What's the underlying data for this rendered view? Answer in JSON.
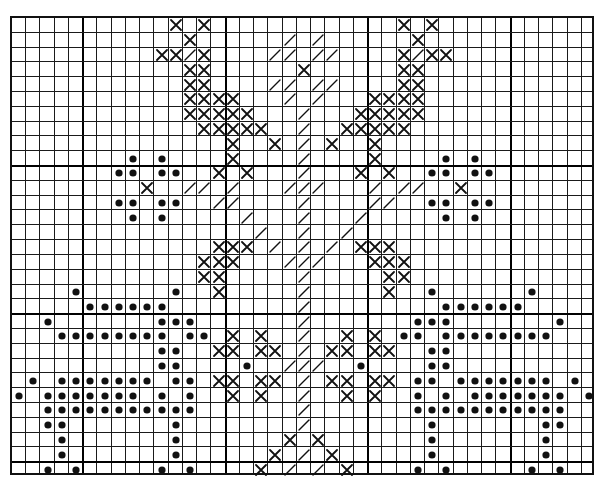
{
  "pattern": {
    "title": "Cross-stitch chart",
    "columns": 41,
    "rows": 31,
    "major_grid_columns": [
      5,
      15,
      25,
      35
    ],
    "major_grid_rows": [
      10,
      20,
      30
    ],
    "legend": {
      "x": "cross-stitch",
      "slash": "half-stitch",
      "dot": "bead / french knot"
    },
    "colors": {
      "ink": "#111111",
      "paper": "#ffffff"
    },
    "marks": [
      {
        "row": 0,
        "x": [
          11,
          13,
          27,
          29
        ],
        "slash": [],
        "dot": []
      },
      {
        "row": 1,
        "x": [
          12,
          28
        ],
        "slash": [
          19,
          21
        ],
        "dot": []
      },
      {
        "row": 2,
        "x": [
          10,
          11,
          13,
          27,
          29,
          30
        ],
        "slash": [
          12,
          18,
          19,
          21,
          22,
          28
        ],
        "dot": []
      },
      {
        "row": 3,
        "x": [
          12,
          13,
          20,
          27,
          28
        ],
        "slash": [],
        "dot": []
      },
      {
        "row": 4,
        "x": [
          12,
          13,
          27,
          28
        ],
        "slash": [
          18,
          19,
          21,
          22
        ],
        "dot": []
      },
      {
        "row": 5,
        "x": [
          12,
          13,
          14,
          15,
          25,
          26,
          27,
          28
        ],
        "slash": [
          19,
          21
        ],
        "dot": []
      },
      {
        "row": 6,
        "x": [
          12,
          13,
          14,
          15,
          16,
          24,
          25,
          26,
          27,
          28
        ],
        "slash": [
          20
        ],
        "dot": []
      },
      {
        "row": 7,
        "x": [
          13,
          14,
          15,
          16,
          17,
          23,
          24,
          25,
          26,
          27
        ],
        "slash": [
          20
        ],
        "dot": []
      },
      {
        "row": 8,
        "x": [
          15,
          18,
          22,
          25
        ],
        "slash": [
          20
        ],
        "dot": []
      },
      {
        "row": 9,
        "x": [
          15,
          25
        ],
        "slash": [
          20
        ],
        "dot": [
          8,
          10,
          30,
          32
        ]
      },
      {
        "row": 10,
        "x": [
          14,
          16,
          24,
          26
        ],
        "slash": [
          20
        ],
        "dot": [
          7,
          8,
          10,
          11,
          29,
          30,
          32,
          33
        ]
      },
      {
        "row": 11,
        "x": [
          9,
          31
        ],
        "slash": [
          12,
          13,
          15,
          19,
          20,
          21,
          25,
          27,
          28
        ],
        "dot": []
      },
      {
        "row": 12,
        "x": [],
        "slash": [
          14,
          15,
          20,
          25,
          26
        ],
        "dot": [
          7,
          8,
          10,
          11,
          29,
          30,
          32,
          33
        ]
      },
      {
        "row": 13,
        "x": [],
        "slash": [
          16,
          20,
          24
        ],
        "dot": [
          8,
          10,
          30,
          32
        ]
      },
      {
        "row": 14,
        "x": [],
        "slash": [
          17,
          20,
          23
        ],
        "dot": []
      },
      {
        "row": 15,
        "x": [
          14,
          15,
          16,
          24,
          25,
          26
        ],
        "slash": [
          18,
          20,
          22
        ],
        "dot": []
      },
      {
        "row": 16,
        "x": [
          13,
          14,
          15,
          25,
          26,
          27
        ],
        "slash": [
          19,
          20,
          21
        ],
        "dot": []
      },
      {
        "row": 17,
        "x": [
          13,
          14,
          26,
          27
        ],
        "slash": [
          20
        ],
        "dot": []
      },
      {
        "row": 18,
        "x": [
          14,
          26
        ],
        "slash": [
          20
        ],
        "dot": [
          4,
          11,
          29,
          36
        ]
      },
      {
        "row": 19,
        "x": [],
        "slash": [
          20
        ],
        "dot": [
          5,
          6,
          7,
          8,
          9,
          10,
          30,
          31,
          32,
          33,
          34,
          35
        ]
      },
      {
        "row": 20,
        "x": [],
        "slash": [
          20
        ],
        "dot": [
          2,
          10,
          11,
          12,
          28,
          29,
          30,
          38
        ]
      },
      {
        "row": 21,
        "x": [
          15,
          17,
          23,
          25
        ],
        "slash": [
          20
        ],
        "dot": [
          3,
          4,
          5,
          6,
          7,
          8,
          9,
          10,
          12,
          13,
          27,
          28,
          30,
          31,
          32,
          33,
          34,
          35,
          36,
          37
        ]
      },
      {
        "row": 22,
        "x": [
          14,
          15,
          17,
          18,
          22,
          23,
          25,
          26
        ],
        "slash": [
          20
        ],
        "dot": [
          10,
          11,
          29,
          30
        ]
      },
      {
        "row": 23,
        "x": [],
        "slash": [
          19,
          20,
          21
        ],
        "dot": [
          10,
          11,
          16,
          24,
          29,
          30
        ]
      },
      {
        "row": 24,
        "x": [
          14,
          15,
          17,
          18,
          22,
          23,
          25,
          26
        ],
        "slash": [
          20
        ],
        "dot": [
          1,
          3,
          4,
          5,
          6,
          7,
          8,
          9,
          11,
          12,
          28,
          29,
          31,
          32,
          33,
          34,
          35,
          36,
          37,
          39
        ]
      },
      {
        "row": 25,
        "x": [
          15,
          17,
          23,
          25
        ],
        "slash": [
          20
        ],
        "dot": [
          0,
          2,
          3,
          4,
          5,
          6,
          7,
          8,
          10,
          12,
          28,
          30,
          32,
          33,
          34,
          35,
          36,
          37,
          38,
          40
        ]
      },
      {
        "row": 26,
        "x": [],
        "slash": [
          20
        ],
        "dot": [
          2,
          3,
          4,
          5,
          6,
          7,
          8,
          9,
          10,
          11,
          12,
          28,
          29,
          30,
          31,
          32,
          33,
          34,
          35,
          36,
          37,
          38
        ]
      },
      {
        "row": 27,
        "x": [],
        "slash": [
          20
        ],
        "dot": [
          2,
          3,
          11,
          29,
          37,
          38
        ]
      },
      {
        "row": 28,
        "x": [
          19,
          21
        ],
        "slash": [],
        "dot": [
          3,
          11,
          29,
          37
        ]
      },
      {
        "row": 29,
        "x": [
          18,
          22
        ],
        "slash": [
          20
        ],
        "dot": [
          3,
          11,
          29,
          37
        ]
      },
      {
        "row": 30,
        "x": [
          17,
          23
        ],
        "slash": [
          19,
          21
        ],
        "dot": [
          2,
          4,
          10,
          12,
          28,
          30,
          36,
          38
        ]
      }
    ]
  }
}
